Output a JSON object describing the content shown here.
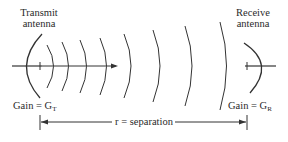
{
  "transmit": {
    "label_line1": "Transmit",
    "label_line2": "antenna",
    "gain_label": "Gain = G",
    "gain_sub": "T"
  },
  "receive": {
    "label_line1": "Receive",
    "label_line2": "antenna",
    "gain_label": "Gain = G",
    "gain_sub": "R"
  },
  "separation": {
    "label": "r = separation"
  },
  "colors": {
    "line": "#333333",
    "text": "#2a2a2a"
  }
}
